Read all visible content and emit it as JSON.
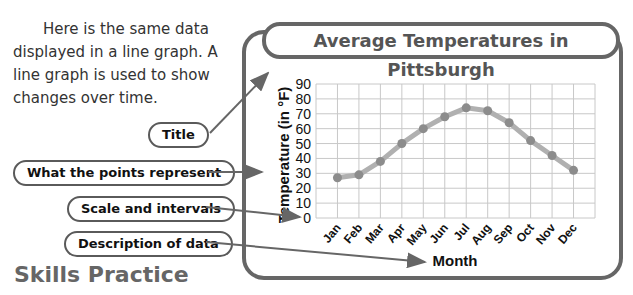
{
  "intro_text": "Here is the same data displayed in a line graph. A line graph is used to show changes over time.",
  "callouts": {
    "title": "Title",
    "points": "What the points represent",
    "scale": "Scale and intervals",
    "description": "Description of data"
  },
  "section_heading": "Skills Practice",
  "colors": {
    "frame": "#666666",
    "line": "#b0b0b0",
    "point": "#8c8c8c",
    "grid": "#c8c8c8"
  },
  "chart_data": {
    "type": "line",
    "title": "Average Temperatures in Pittsburgh",
    "xlabel": "Month",
    "ylabel": "Temperature (in °F)",
    "categories": [
      "Jan",
      "Feb",
      "Mar",
      "Apr",
      "May",
      "Jun",
      "Jul",
      "Aug",
      "Sep",
      "Oct",
      "Nov",
      "Dec"
    ],
    "values": [
      27,
      29,
      38,
      50,
      60,
      68,
      74,
      72,
      64,
      52,
      42,
      32
    ],
    "yticks": [
      0,
      10,
      20,
      30,
      40,
      50,
      60,
      70,
      80,
      90
    ],
    "ylim": [
      0,
      90
    ],
    "grid": true,
    "legend": null
  }
}
